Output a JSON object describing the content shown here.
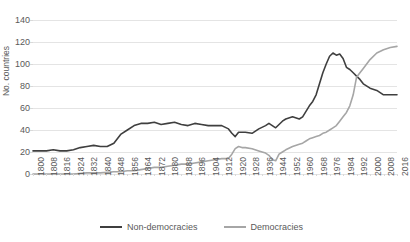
{
  "chart_data": {
    "type": "line",
    "title": "Number of democracies and non-democracies",
    "xlabel": "",
    "ylabel": "No. countries",
    "ylim": [
      0,
      140
    ],
    "ytick_step": 20,
    "yticks": [
      140,
      120,
      100,
      80,
      60,
      40,
      20,
      0
    ],
    "xlim": [
      1800,
      2016
    ],
    "xtick_step": 8,
    "grid": true,
    "legend_position": "bottom",
    "categories": [
      1800,
      1808,
      1816,
      1824,
      1832,
      1840,
      1848,
      1856,
      1864,
      1872,
      1880,
      1888,
      1896,
      1904,
      1912,
      1920,
      1928,
      1936,
      1944,
      1952,
      1960,
      1968,
      1976,
      1984,
      1992,
      2000,
      2008,
      2016
    ],
    "series": [
      {
        "name": "Non-democracies",
        "color": "#3f3f3f",
        "x": [
          1800,
          1804,
          1808,
          1812,
          1816,
          1820,
          1824,
          1828,
          1832,
          1836,
          1840,
          1844,
          1848,
          1852,
          1856,
          1860,
          1864,
          1868,
          1872,
          1876,
          1880,
          1884,
          1888,
          1892,
          1896,
          1900,
          1904,
          1908,
          1912,
          1916,
          1918,
          1920,
          1922,
          1926,
          1930,
          1934,
          1938,
          1940,
          1942,
          1944,
          1946,
          1948,
          1950,
          1954,
          1958,
          1960,
          1962,
          1964,
          1966,
          1968,
          1970,
          1972,
          1974,
          1976,
          1978,
          1980,
          1982,
          1984,
          1986,
          1988,
          1990,
          1992,
          1994,
          1996,
          2000,
          2004,
          2008,
          2012,
          2016
        ],
        "values": [
          21,
          21,
          21,
          22,
          21,
          21,
          22,
          24,
          25,
          26,
          25,
          25,
          28,
          36,
          40,
          44,
          46,
          46,
          47,
          45,
          46,
          47,
          45,
          44,
          46,
          45,
          44,
          44,
          44,
          41,
          37,
          34,
          38,
          38,
          37,
          41,
          44,
          46,
          44,
          42,
          45,
          48,
          50,
          52,
          50,
          52,
          57,
          62,
          66,
          72,
          82,
          92,
          100,
          107,
          110,
          108,
          109,
          105,
          97,
          95,
          92,
          89,
          86,
          82,
          78,
          76,
          72,
          72,
          72
        ]
      },
      {
        "name": "Democracies",
        "color": "#a6a6a6",
        "x": [
          1800,
          1808,
          1816,
          1824,
          1832,
          1840,
          1848,
          1852,
          1856,
          1860,
          1864,
          1868,
          1872,
          1876,
          1880,
          1884,
          1888,
          1892,
          1896,
          1900,
          1904,
          1908,
          1912,
          1916,
          1918,
          1920,
          1922,
          1924,
          1926,
          1930,
          1934,
          1938,
          1940,
          1942,
          1944,
          1946,
          1948,
          1950,
          1954,
          1958,
          1960,
          1962,
          1964,
          1966,
          1968,
          1970,
          1972,
          1974,
          1976,
          1978,
          1980,
          1982,
          1984,
          1986,
          1988,
          1990,
          1992,
          1994,
          1996,
          2000,
          2004,
          2008,
          2012,
          2016
        ],
        "values": [
          0,
          0,
          0,
          0,
          1,
          1,
          2,
          2,
          3,
          3,
          4,
          5,
          6,
          6,
          7,
          8,
          9,
          9,
          10,
          11,
          12,
          13,
          14,
          14,
          18,
          23,
          25,
          24,
          24,
          23,
          21,
          19,
          17,
          13,
          12,
          18,
          20,
          22,
          25,
          27,
          28,
          30,
          32,
          33,
          34,
          35,
          37,
          38,
          40,
          42,
          44,
          48,
          52,
          56,
          62,
          72,
          88,
          92,
          96,
          104,
          110,
          113,
          115,
          116
        ]
      }
    ]
  },
  "axis": {
    "y_title": "No. countries"
  },
  "legend": {
    "items": [
      {
        "label": "Non-democracies",
        "color": "#3f3f3f"
      },
      {
        "label": "Democracies",
        "color": "#a6a6a6"
      }
    ]
  }
}
